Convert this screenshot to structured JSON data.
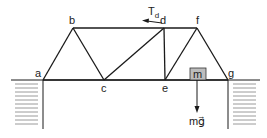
{
  "diagram": {
    "type": "truss",
    "nodes": [
      {
        "id": "a",
        "label": "a"
      },
      {
        "id": "b",
        "label": "b"
      },
      {
        "id": "c",
        "label": "c"
      },
      {
        "id": "d",
        "label": "d"
      },
      {
        "id": "e",
        "label": "e"
      },
      {
        "id": "f",
        "label": "f"
      },
      {
        "id": "g",
        "label": "g"
      }
    ],
    "members": [
      [
        "a",
        "b"
      ],
      [
        "b",
        "c"
      ],
      [
        "c",
        "d"
      ],
      [
        "d",
        "e"
      ],
      [
        "e",
        "f"
      ],
      [
        "f",
        "g"
      ],
      [
        "b",
        "d"
      ],
      [
        "d",
        "f"
      ],
      [
        "a",
        "c"
      ],
      [
        "c",
        "e"
      ],
      [
        "e",
        "g"
      ]
    ],
    "force_label": {
      "main": "T",
      "subscript": "d"
    },
    "mass_label": "m",
    "weight_label": "mg⃗",
    "colors": {
      "line": "#1a1a1a",
      "hatch": "#9a9a9a",
      "mass_box": "#bdbdbd"
    }
  }
}
